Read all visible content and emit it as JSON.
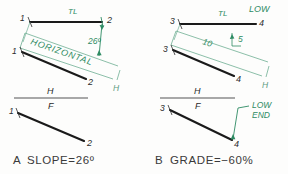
{
  "figure": {
    "background_color": "#fdfdfc",
    "object_line_color": "#1a1a1a",
    "construction_line_color": "#3f8f6f",
    "annotation_color": "#2e8b63",
    "point_label_color": "#2a2a2a"
  },
  "panels": [
    {
      "id": "panel-a",
      "caption": "A  SLOPE=26º",
      "caption_key": "A",
      "caption_body": "SLOPE=26º",
      "fold_line": {
        "upper_label": "H",
        "lower_label": "F"
      },
      "top_view": {
        "name": "horizontal-projection",
        "line_label": "TL",
        "point_start_label": "1",
        "point_end_label": "2",
        "reference_mark_label": "H"
      },
      "auxiliary_view": {
        "name": "elevation-auxiliary",
        "plane_label": "HORIZONTAL",
        "angle_label": "26º",
        "point_start_label": "1",
        "point_end_label": "2"
      },
      "front_view": {
        "name": "frontal-projection",
        "point_start_label": "1",
        "point_end_label": "2"
      }
    },
    {
      "id": "panel-b",
      "caption": "B  GRADE=−60%",
      "caption_key": "B",
      "caption_body": "GRADE=−60%",
      "fold_line": {
        "upper_label": "H",
        "lower_label": "F"
      },
      "top_view": {
        "name": "horizontal-projection",
        "line_label": "TL",
        "low_label": "LOW",
        "point_start_label": "3",
        "point_end_label": "4",
        "reference_mark_label": "H"
      },
      "auxiliary_view": {
        "name": "elevation-auxiliary",
        "run_label": "10",
        "rise_label": "5",
        "point_start_label": "3",
        "point_end_label": "4"
      },
      "front_view": {
        "name": "frontal-projection",
        "point_start_label": "3",
        "point_end_label": "4",
        "low_end_label_line1": "LOW",
        "low_end_label_line2": "END"
      }
    }
  ]
}
